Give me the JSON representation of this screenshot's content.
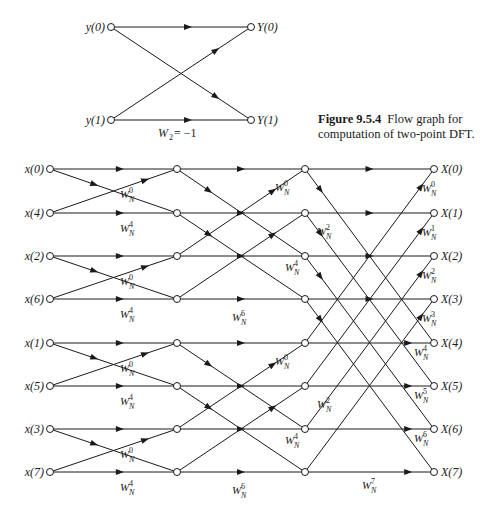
{
  "butterfly": {
    "inputs": [
      "y(0)",
      "y(1)"
    ],
    "outputs": [
      "Y(0)",
      "Y(1)"
    ],
    "twiddle_label": "W",
    "twiddle_sub": "2",
    "twiddle_value": " = −1"
  },
  "caption": {
    "figure_number": "Figure 9.5.4",
    "text": "Flow graph for computation of two-point DFT."
  },
  "fft": {
    "inputs": [
      "x(0)",
      "x(4)",
      "x(2)",
      "x(6)",
      "x(1)",
      "x(5)",
      "x(3)",
      "x(7)"
    ],
    "outputs": [
      "X(0)",
      "X(1)",
      "X(2)",
      "X(3)",
      "X(4)",
      "X(5)",
      "X(6)",
      "X(7)"
    ],
    "stage1_twiddles": [
      "0",
      "4",
      "0",
      "4",
      "0",
      "4",
      "0",
      "4"
    ],
    "stage2_twiddles": [
      "0",
      "2",
      "4",
      "6",
      "0",
      "2",
      "4",
      "6"
    ],
    "stage3_twiddles": [
      "0",
      "1",
      "2",
      "3",
      "4",
      "5",
      "6",
      "7"
    ],
    "twiddle_base": "W",
    "twiddle_sub": "N"
  },
  "colors": {
    "line": "#1a1a1a",
    "background": "#ffffff"
  }
}
